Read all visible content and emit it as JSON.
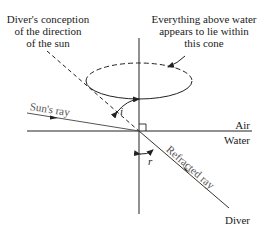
{
  "diagram": {
    "labels": {
      "conception": [
        "Diver's conception",
        "of the direction",
        "of the sun"
      ],
      "cone_note": [
        "Everything above water",
        "appears to lie within",
        "this cone"
      ],
      "sun_ray": "Sun's ray",
      "angle_i": "i",
      "angle_r": "r",
      "air": "Air",
      "water": "Water",
      "refracted_ray": "Refracted ray",
      "diver": "Diver"
    },
    "colors": {
      "line": "#222222",
      "background": "#ffffff"
    }
  }
}
